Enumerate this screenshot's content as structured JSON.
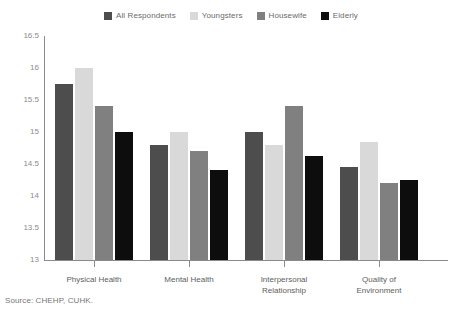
{
  "chart_data": {
    "type": "bar",
    "title": "",
    "xlabel": "",
    "ylabel": "",
    "ylim": [
      13,
      16.5
    ],
    "yticks": [
      13,
      13.5,
      14,
      14.5,
      15,
      15.5,
      16,
      16.5
    ],
    "ytick_labels": [
      "13",
      "13.5",
      "14",
      "14.5",
      "15",
      "15.5",
      "16",
      "16.5"
    ],
    "grid": false,
    "legend_position": "top-center",
    "categories": [
      "Physical Health",
      "Mental Health",
      "Interpersonal\nRelationship",
      "Quality of\nEnvironment"
    ],
    "series": [
      {
        "name": "All Respondents",
        "color": "#4d4d4d",
        "values": [
          15.75,
          14.8,
          15.0,
          14.45
        ]
      },
      {
        "name": "Youngsters",
        "color": "#d9d9d9",
        "values": [
          16.0,
          15.0,
          14.8,
          14.85
        ]
      },
      {
        "name": "Housewife",
        "color": "#808080",
        "values": [
          15.4,
          14.7,
          15.4,
          14.2
        ]
      },
      {
        "name": "Elderly",
        "color": "#0d0d0d",
        "values": [
          15.0,
          14.4,
          14.62,
          14.25
        ]
      }
    ]
  },
  "legend": {
    "items": [
      {
        "label": "All Respondents",
        "color": "#4d4d4d"
      },
      {
        "label": "Youngsters",
        "color": "#d9d9d9"
      },
      {
        "label": "Housewife",
        "color": "#808080"
      },
      {
        "label": "Elderly",
        "color": "#0d0d0d"
      }
    ]
  },
  "footer": {
    "source": "Source: CHEHP, CUHK."
  }
}
